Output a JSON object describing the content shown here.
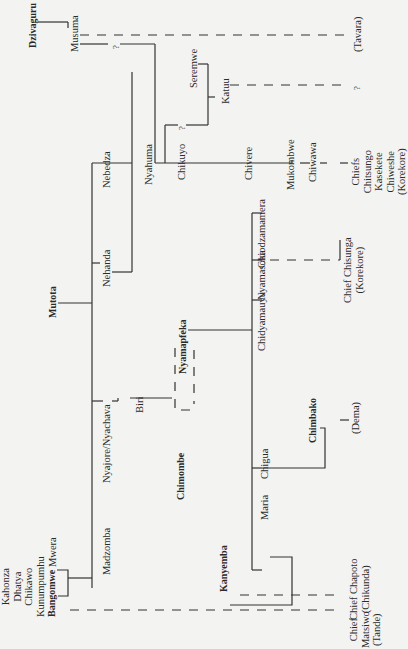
{
  "diagram": {
    "orientation": "rotated 90 degrees counter-clockwise",
    "nodes": {
      "dzivaguru": "Dzivaguru",
      "musuma": "Musuma",
      "tavara": "(Tavara)",
      "nebedza": "Nebedza",
      "nyahuma": "Nyahuma",
      "chikuyo": "Chikuyo",
      "seremwe": "Seremwe",
      "katuu": "Katuu",
      "chivere": "Chivere",
      "mukombwe": "Mukombwe",
      "chiwawa": "Chiwawa",
      "chiefs_korekore": "Chiefs\nChitsungo\nKasekete\nChiweshe\n(Korekore)",
      "mutota": "Mutota",
      "nehanda": "Nehanda",
      "nyajore": "Nyajore/Nyachava",
      "biri": "Biri",
      "nyamapfeka": "Nyamapfeka",
      "chiodzamamera": "Chiodzamamera",
      "nyamasoka": "Nyamasoka",
      "chidyamauyu": "Chidyamauyu",
      "chief_chisunga": "Chief Chisunga\n(Korekore)",
      "chimbako": "Chimbako",
      "dema": "(Dema)",
      "chigua": "Chigua",
      "maria": "Maria",
      "chimombe": "Chimombe",
      "kanyemba": "Kanyemba",
      "chief_chapoto": "Chief Chapoto\n(Chikunda)",
      "mwera": "Mwera",
      "madzomba": "Madzomba",
      "ancestors": "Kahonza\nDhatya\nChikawo\nKunumpumhu",
      "bangomwe": "Bangomwe",
      "chief_matsiwo": "Chief\nMatsiwo\n(Tande)",
      "unknown_1": "?",
      "unknown_2": "?",
      "unknown_3": "?"
    },
    "colors": {
      "background": "#f3f3f1",
      "ink": "#2a2a2a"
    }
  }
}
